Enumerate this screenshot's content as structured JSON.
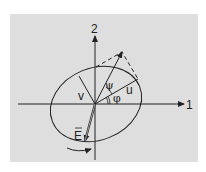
{
  "diagram": {
    "axes": {
      "x_label": "1",
      "y_label": "2"
    },
    "labels": {
      "field": "E",
      "major_axis": "u",
      "minor_axis": "v",
      "orientation_angle": "φ",
      "ellipticity_angle": "ψ"
    },
    "colors": {
      "background": "#dedede",
      "ink": "#222222"
    }
  }
}
